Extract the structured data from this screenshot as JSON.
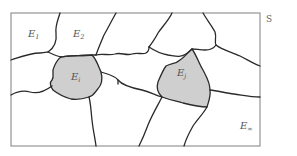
{
  "diagram": {
    "space_label": "S",
    "regions": [
      {
        "id": "E1",
        "base": "E",
        "sub": "1",
        "shaded": false
      },
      {
        "id": "E2",
        "base": "E",
        "sub": "2",
        "shaded": false
      },
      {
        "id": "Ei",
        "base": "E",
        "sub": "i",
        "shaded": true
      },
      {
        "id": "Ej",
        "base": "E",
        "sub": "j",
        "shaded": true
      },
      {
        "id": "Einf",
        "base": "E",
        "sub": "∞",
        "shaded": false
      }
    ],
    "colors": {
      "shaded_fill": "#cfcfcf",
      "boundary": "#2a2a2a",
      "frame": "#8a8a8a",
      "background": "#ffffff"
    }
  }
}
